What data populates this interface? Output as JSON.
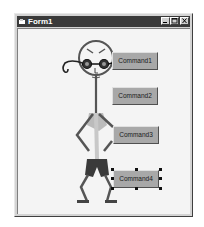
{
  "window": {
    "title": "Form1",
    "controls": {
      "minimize": "minimize",
      "maximize": "maximize",
      "close": "close"
    }
  },
  "form": {
    "grid": "dotted design grid",
    "buttons": [
      {
        "label": "Command1"
      },
      {
        "label": "Command2"
      },
      {
        "label": "Command3"
      },
      {
        "label": "Command4",
        "selected": true
      }
    ]
  },
  "colors": {
    "titlebar": "#3a3a3a",
    "button_face": "#a8a8a8",
    "form_bg": "#f4f4f4"
  }
}
